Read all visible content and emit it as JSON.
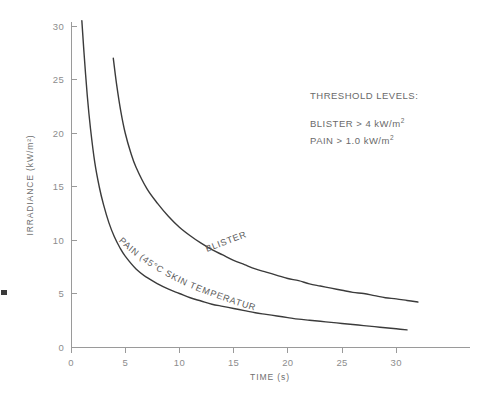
{
  "chart_data": {
    "type": "line",
    "title": "",
    "xlabel": "TIME (s)",
    "ylabel": "IRRADIANCE (kW/m²)",
    "xlim": [
      0,
      35
    ],
    "ylim": [
      0,
      31.5
    ],
    "grid": false,
    "legend_position": "inline-curve-labels",
    "xticks": [
      0,
      5,
      10,
      15,
      20,
      25,
      30
    ],
    "xticklabels": [
      "0",
      "5",
      "10",
      "15",
      "20",
      "25",
      "30"
    ],
    "yticks": [
      0,
      5,
      10,
      15,
      20,
      25,
      30
    ],
    "yticklabels": [
      "0",
      "5",
      "10",
      "15",
      "20",
      "25",
      "30"
    ],
    "series": [
      {
        "name": "BLISTER",
        "label": "BLISTER",
        "color": "#3b3b3b",
        "x": [
          3.9,
          4.2,
          4.6,
          5.0,
          5.5,
          6.0,
          7.0,
          8.0,
          9.0,
          10.0,
          11.0,
          12.0,
          13.0,
          14.0,
          15.0,
          16.0,
          17.0,
          18.0,
          19.0,
          20.0,
          21.0,
          22.0,
          23.0,
          24.0,
          25.0,
          26.0,
          27.0,
          28.0,
          29.0,
          30.0,
          31.0,
          32.0
        ],
        "y": [
          27.0,
          24.6,
          22.0,
          20.0,
          18.2,
          16.8,
          14.8,
          13.4,
          12.2,
          11.2,
          10.4,
          9.7,
          9.1,
          8.6,
          8.1,
          7.7,
          7.3,
          7.0,
          6.7,
          6.4,
          6.2,
          5.9,
          5.7,
          5.5,
          5.3,
          5.1,
          5.0,
          4.8,
          4.6,
          4.5,
          4.35,
          4.2
        ]
      },
      {
        "name": "PAIN",
        "label": "PAIN (45°C SKIN TEMPERATURE)",
        "color": "#3b3b3b",
        "x": [
          1.0,
          1.2,
          1.5,
          1.8,
          2.2,
          2.6,
          3.0,
          3.5,
          4.0,
          4.5,
          5.0,
          6.0,
          7.0,
          8.0,
          9.0,
          10.0,
          11.0,
          12.0,
          13.0,
          14.0,
          15.0,
          16.0,
          17.0,
          18.0,
          19.0,
          20.0,
          21.0,
          22.0,
          23.0,
          24.0,
          25.0,
          26.0,
          27.0,
          28.0,
          29.0,
          30.0,
          31.0
        ],
        "y": [
          30.5,
          27.5,
          23.5,
          20.4,
          17.2,
          15.0,
          13.3,
          11.6,
          10.3,
          9.3,
          8.5,
          7.3,
          6.5,
          5.9,
          5.4,
          5.0,
          4.6,
          4.3,
          4.0,
          3.8,
          3.6,
          3.4,
          3.2,
          3.05,
          2.9,
          2.75,
          2.6,
          2.5,
          2.4,
          2.3,
          2.2,
          2.1,
          2.0,
          1.9,
          1.8,
          1.7,
          1.6
        ]
      }
    ],
    "annotations": {
      "threshold_heading": "THRESHOLD LEVELS:",
      "threshold_lines": [
        {
          "text": "BLISTER > 4 kW/m",
          "sup": "2"
        },
        {
          "text": "PAIN > 1.0 kW/m",
          "sup": "2"
        }
      ]
    }
  }
}
